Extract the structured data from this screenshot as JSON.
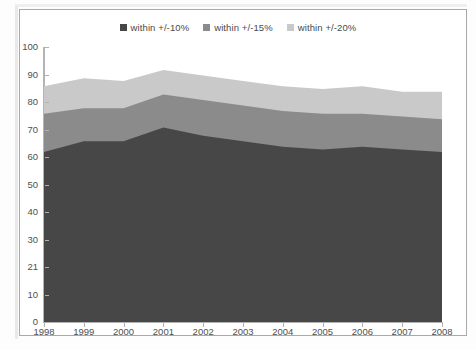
{
  "chart_data": {
    "type": "area",
    "stacked": true,
    "title": "",
    "subtitle": "",
    "xlabel": "",
    "ylabel": "",
    "xlim": [
      1998,
      2008
    ],
    "ylim": [
      0,
      100
    ],
    "grid": false,
    "legend_position": "top-center",
    "categories": [
      "1998",
      "1999",
      "2000",
      "2001",
      "2002",
      "2003",
      "2004",
      "2005",
      "2006",
      "2007",
      "2008"
    ],
    "x": [
      1998,
      1999,
      2000,
      2001,
      2002,
      2003,
      2004,
      2005,
      2006,
      2007,
      2008
    ],
    "series": [
      {
        "name": "within +/-10%",
        "color": "#474747",
        "values": [
          62,
          66,
          66,
          71,
          68,
          66,
          64,
          63,
          64,
          63,
          62
        ]
      },
      {
        "name": "within +/-15%",
        "color": "#8b8b8b",
        "values": [
          14,
          12,
          12,
          12,
          13,
          13,
          13,
          13,
          12,
          12,
          12
        ]
      },
      {
        "name": "within +/-20%",
        "color": "#c9c9c9",
        "values": [
          10,
          11,
          10,
          9,
          9,
          9,
          9,
          9,
          10,
          9,
          10
        ]
      }
    ],
    "cumulative": [
      {
        "name": "within +/-10%",
        "values": [
          62,
          66,
          66,
          71,
          68,
          66,
          64,
          63,
          64,
          63,
          62
        ]
      },
      {
        "name": "within +/-15%",
        "values": [
          76,
          78,
          78,
          83,
          81,
          79,
          77,
          76,
          76,
          75,
          74
        ]
      },
      {
        "name": "within +/-20%",
        "values": [
          86,
          89,
          88,
          92,
          90,
          88,
          86,
          85,
          86,
          84,
          84
        ]
      }
    ],
    "y_ticks": [
      {
        "value": 100,
        "label": "100"
      },
      {
        "value": 90,
        "label": "90"
      },
      {
        "value": 80,
        "label": "80"
      },
      {
        "value": 70,
        "label": "70"
      },
      {
        "value": 60,
        "label": "60"
      },
      {
        "value": 50,
        "label": "50"
      },
      {
        "value": 40,
        "label": "40"
      },
      {
        "value": 30,
        "label": "30"
      },
      {
        "value": 20,
        "label": "21"
      },
      {
        "value": 10,
        "label": "10"
      },
      {
        "value": 0,
        "label": "0"
      }
    ],
    "x_ticks": [
      "1998",
      "1999",
      "2000",
      "2001",
      "2002",
      "2003",
      "2004",
      "2005",
      "2006",
      "2007",
      "2008"
    ]
  },
  "legend": {
    "items": [
      {
        "label": "within +/-10%",
        "color": "#474747"
      },
      {
        "label": "within +/-15%",
        "color": "#8b8b8b"
      },
      {
        "label": "within +/-20%",
        "color": "#c9c9c9"
      }
    ]
  },
  "colors": {
    "axis": "#b4b4b4",
    "tick_text": "#4f4f4f",
    "frame": "#a9a9a9",
    "background": "#ffffff"
  }
}
